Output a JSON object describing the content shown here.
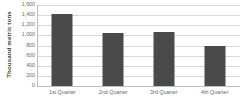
{
  "chart_data": {
    "type": "bar",
    "title": "",
    "subtitle": "",
    "xlabel": "",
    "ylabel": "Thousand metric tons",
    "categories": [
      "1st Quarter",
      "2nd Quarter",
      "3rd Quarter",
      "4th Quarter"
    ],
    "values": [
      1430,
      1050,
      1065,
      790
    ],
    "ylim": [
      0,
      1600
    ],
    "ytick_step": 200,
    "ytick_labels": [
      "0",
      "200",
      "400",
      "600",
      "800",
      "1,000",
      "1,200",
      "1,400",
      "1,600"
    ],
    "ytick_values": [
      0,
      200,
      400,
      600,
      800,
      1000,
      1200,
      1400,
      1600
    ],
    "grid": "horizontal",
    "legend": "none",
    "series": [
      {
        "name": "",
        "values": [
          1430,
          1050,
          1065,
          790
        ]
      }
    ],
    "colors": {
      "bar": "#4a4a4a",
      "gridline": "#d9d9d9",
      "axis": "#bfbfbf",
      "tick_text": "#6b6b6b",
      "axis_title_text": "#3f3f3f",
      "background": "#ffffff"
    }
  }
}
